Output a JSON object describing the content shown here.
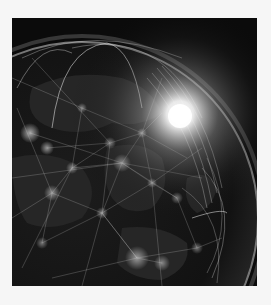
{
  "image": {
    "subject": "Earth at night with glowing global network connection lines and sunrise glow",
    "alt": "Night-side globe with city lights and network arcs, bright sun flare on the horizon",
    "colors": {
      "page_background": "#f6f6f6",
      "space": "#0b0b0b",
      "globe": "#151515",
      "glow": "#ffffff",
      "lines": "#d8d8d8"
    }
  }
}
